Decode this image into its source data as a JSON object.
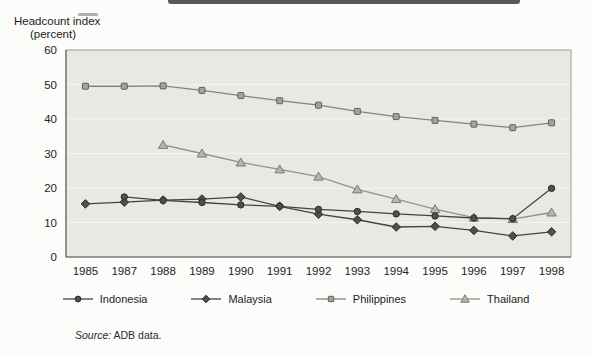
{
  "page": {
    "title_line1": "Headcount index",
    "title_line2": "(percent)",
    "source_label": "Source:",
    "source_text": "ADB data."
  },
  "colors": {
    "page_background": "#fcfcfa",
    "plot_background": "#e8e8e5",
    "plot_border": "#9b9b99",
    "axis_line": "#6b6b69",
    "gridline": "#f4f4f1",
    "text": "#23231f",
    "indonesia": "#45433f",
    "malaysia": "#45433f",
    "philippines": "#84847f",
    "thailand": "#92928a"
  },
  "chart_data": {
    "type": "line",
    "title": "",
    "xlabel": "",
    "ylabel": "Headcount index (percent)",
    "ylim": [
      0,
      60
    ],
    "yticks": [
      0,
      10,
      20,
      30,
      40,
      50,
      60
    ],
    "grid": "horizontal, faint",
    "legend_position": "bottom",
    "categories": [
      "1985",
      "1987",
      "1988",
      "1989",
      "1990",
      "1991",
      "1992",
      "1993",
      "1994",
      "1995",
      "1996",
      "1997",
      "1998"
    ],
    "series": [
      {
        "name": "Indonesia",
        "marker": "circle",
        "line_color": "#45433f",
        "marker_fill": "#514f4b",
        "marker_stroke": "#2e2d2a",
        "values": [
          null,
          17.4,
          16.4,
          15.8,
          15.1,
          14.7,
          13.8,
          13.2,
          12.5,
          11.9,
          11.3,
          11.1,
          19.9
        ]
      },
      {
        "name": "Malaysia",
        "marker": "diamond",
        "line_color": "#45433f",
        "marker_fill": "#514f4b",
        "marker_stroke": "#2e2d2a",
        "values": [
          15.4,
          15.9,
          16.5,
          16.8,
          17.4,
          14.7,
          12.4,
          10.8,
          8.7,
          8.9,
          7.7,
          6.1,
          7.3
        ]
      },
      {
        "name": "Philippines",
        "marker": "square",
        "line_color": "#84847f",
        "marker_fill": "#a3a39e",
        "marker_stroke": "#5f5f5b",
        "values": [
          49.5,
          49.5,
          49.6,
          48.3,
          46.8,
          45.3,
          44.0,
          42.2,
          40.7,
          39.6,
          38.5,
          37.5,
          38.9
        ]
      },
      {
        "name": "Thailand",
        "marker": "triangle",
        "line_color": "#92928a",
        "marker_fill": "#b6b6af",
        "marker_stroke": "#79796f",
        "values": [
          null,
          null,
          32.5,
          30.0,
          27.4,
          25.4,
          23.3,
          19.6,
          16.8,
          13.9,
          11.4,
          11.0,
          12.9
        ]
      }
    ]
  }
}
